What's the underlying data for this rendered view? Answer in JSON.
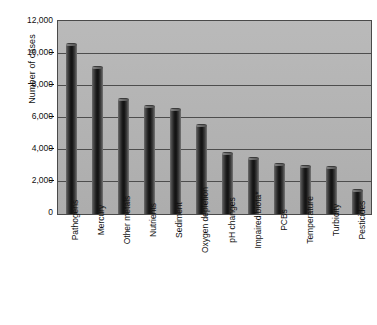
{
  "chart_data": {
    "type": "bar",
    "title": "",
    "xlabel": "",
    "ylabel": "Number of cases",
    "ylim": [
      0,
      12000
    ],
    "ytick_values": [
      12000,
      10000,
      8000,
      6000,
      4000,
      2000,
      0
    ],
    "ytick_labels": [
      "12,000",
      "10,000",
      "8,000",
      "6,000",
      "4,000",
      "2,000",
      "0"
    ],
    "grid": true,
    "legend": false,
    "orientation": "vertical",
    "categories": [
      "Pathogens",
      "Mercury",
      "Other metals",
      "Nutrients",
      "Sediment",
      "Oxygen depletion",
      "pH changes",
      "Impaired biota*",
      "PCBs",
      "Temperature",
      "Turbidity",
      "Pesticides"
    ],
    "values": [
      10500,
      9050,
      7100,
      6650,
      6450,
      5500,
      3750,
      3400,
      3050,
      2900,
      2850,
      1450
    ],
    "colors": {
      "plot_background": "#b6b6b6",
      "bar_fill": "#1c1c1c",
      "bar_highlight": "#7a7a7a",
      "axis": "#4a4a4a",
      "gridline": "#4d4d4d",
      "text": "#111111",
      "figure_background": "#ffffff"
    }
  }
}
